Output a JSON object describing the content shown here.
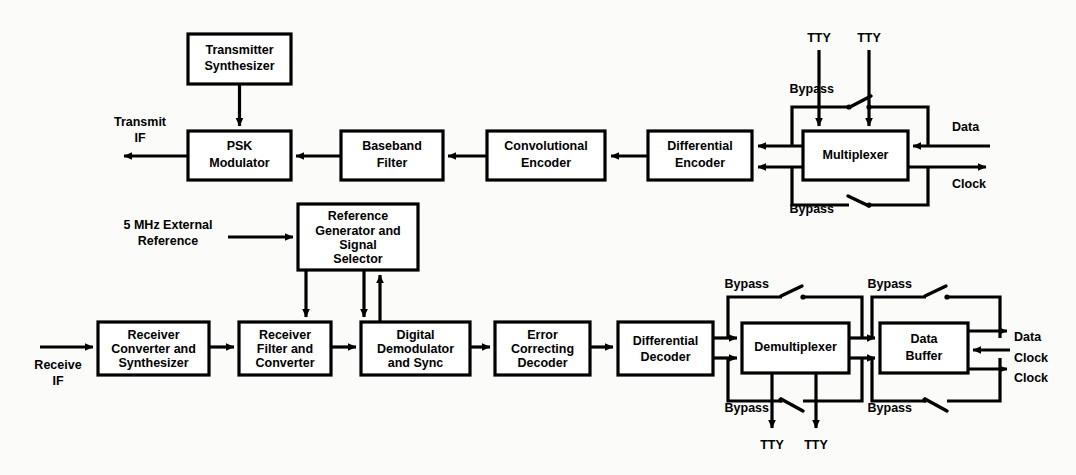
{
  "diagram": {
    "style": {
      "line_color": "#000000",
      "box_fill": "#ffffff",
      "background": "#fbfbf9"
    },
    "transmit_chain": {
      "blocks": [
        {
          "id": "transmitter-synthesizer",
          "lines": [
            "Transmitter",
            "Synthesizer"
          ]
        },
        {
          "id": "psk-modulator",
          "lines": [
            "PSK",
            "Modulator"
          ]
        },
        {
          "id": "baseband-filter",
          "lines": [
            "Baseband",
            "Filter"
          ]
        },
        {
          "id": "convolutional-encoder",
          "lines": [
            "Convolutional",
            "Encoder"
          ]
        },
        {
          "id": "differential-encoder",
          "lines": [
            "Differential",
            "Encoder"
          ]
        },
        {
          "id": "multiplexer",
          "lines": [
            "Multiplexer"
          ]
        }
      ],
      "io_labels": {
        "transmit_if": [
          "Transmit",
          "IF"
        ],
        "tty_left": "TTY",
        "tty_right": "TTY",
        "bypass_upper": "Bypass",
        "bypass_lower": "Bypass",
        "data": "Data",
        "clock": "Clock"
      }
    },
    "receive_chain": {
      "blocks": [
        {
          "id": "reference-generator",
          "lines": [
            "Reference",
            "Generator and",
            "Signal",
            "Selector"
          ]
        },
        {
          "id": "receiver-converter",
          "lines": [
            "Receiver",
            "Converter and",
            "Synthesizer"
          ]
        },
        {
          "id": "receiver-filter",
          "lines": [
            "Receiver",
            "Filter and",
            "Converter"
          ]
        },
        {
          "id": "digital-demodulator",
          "lines": [
            "Digital",
            "Demodulator",
            "and Sync"
          ]
        },
        {
          "id": "error-correcting-decoder",
          "lines": [
            "Error",
            "Correcting",
            "Decoder"
          ]
        },
        {
          "id": "differential-decoder",
          "lines": [
            "Differential",
            "Decoder"
          ]
        },
        {
          "id": "demultiplexer",
          "lines": [
            "Demultiplexer"
          ]
        },
        {
          "id": "data-buffer",
          "lines": [
            "Data",
            "Buffer"
          ]
        }
      ],
      "io_labels": {
        "external_reference": [
          "5 MHz External",
          "Reference"
        ],
        "receive_if": [
          "Receive",
          "IF"
        ],
        "bypass_demux_upper": "Bypass",
        "bypass_demux_lower": "Bypass",
        "bypass_buffer_upper": "Bypass",
        "bypass_buffer_lower": "Bypass",
        "tty_left": "TTY",
        "tty_right": "TTY",
        "data": "Data",
        "clock_in": "Clock",
        "clock_out": "Clock"
      }
    }
  }
}
